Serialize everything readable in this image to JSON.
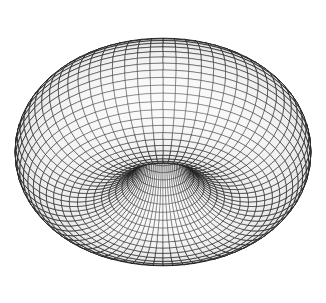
{
  "figure": {
    "background": "#ffffff",
    "line_color": "#1a1a1a",
    "fill_color": "#f4f4f4",
    "center": [
      163,
      152
    ],
    "major_radius": 85.5,
    "minor_radius": 62.5,
    "view_tilt_cos": 0.6,
    "u_segments": 72,
    "v_segments": 48
  }
}
